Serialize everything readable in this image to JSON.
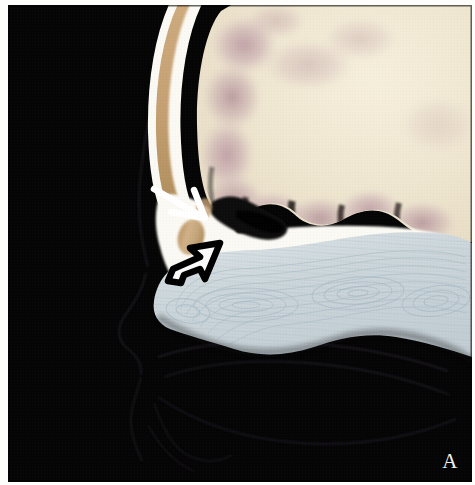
{
  "figure": {
    "kind": "medical-image",
    "modality": "sagittal anatomical section",
    "panel_label": "A",
    "background_color": "#050505",
    "paper_color": "#fdfdfb"
  },
  "canvas": {
    "width": 475,
    "height": 485,
    "scan_left": 8,
    "scan_top": 5,
    "scan_width": 464,
    "scan_height": 477
  },
  "palette": {
    "background_black": "#050505",
    "bone_cortical_white": "#fbf9f3",
    "bone_marrow_tan": "#c9a574",
    "bone_marrow_tan_dark": "#a8884f",
    "brain_cream": "#efe6d0",
    "brain_cream_light": "#f5eeda",
    "gyri_mauve": "#c0a2aa",
    "gyri_mauve_deep": "#a8838f",
    "sulci_dark": "#151210",
    "turbinate_blue_gray": "#cdd6da",
    "turbinate_blue_light": "#dde4e7",
    "turbinate_contour_line": "#aebdc6",
    "soft_tissue_outline": "#1d1a1f",
    "arrow_white": "#ffffff",
    "arrow_black": "#000000",
    "label_white": "#f2f0ea"
  },
  "structures": [
    {
      "name": "background-air",
      "label": "Air / background",
      "color": "#050505"
    },
    {
      "name": "frontal-bone",
      "label": "Frontal bone (calvarium)",
      "outer_table_color": "#fbf9f3",
      "diploe_color": "#c9a574"
    },
    {
      "name": "frontal-lobe-brain",
      "label": "Frontal lobe (brain parenchyma)",
      "color": "#efe6d0",
      "gyri_color": "#c0a2aa"
    },
    {
      "name": "frontal-sinus-air",
      "label": "Frontal / ethmoid sinus air",
      "color": "#0a0a0a"
    },
    {
      "name": "skull-base-plate",
      "label": "Anterior skull base / cribriform plate",
      "color": "#fbf9f3"
    },
    {
      "name": "nasal-turbinates",
      "label": "Nasal turbinates / mucosa",
      "color": "#cdd6da"
    },
    {
      "name": "facial-soft-tissue-profile",
      "label": "Facial soft tissue profile (nose, lips, palate)",
      "color": "#1a1720"
    }
  ],
  "annotations": {
    "white_arrow": {
      "name": "white-solid-arrow",
      "label": "White arrow",
      "style": "solid line arrow",
      "color": "#ffffff",
      "direction": "down-right",
      "tail": {
        "x": 148,
        "y": 185
      },
      "tip": {
        "x": 197,
        "y": 213
      }
    },
    "black_arrow": {
      "name": "black-open-arrow",
      "label": "Open (outlined) arrow",
      "style": "hollow outlined arrow",
      "outline_color": "#000000",
      "fill_color": "#ffffff",
      "direction": "up-right",
      "tail": {
        "x": 173,
        "y": 275
      },
      "tip": {
        "x": 212,
        "y": 240
      }
    }
  },
  "label": {
    "text": "A",
    "color": "#f2f0ea",
    "position": "bottom-right"
  }
}
